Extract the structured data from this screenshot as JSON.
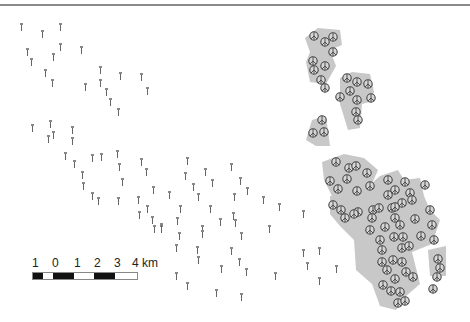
{
  "map": {
    "scale_bar": {
      "labels": [
        "1",
        "0",
        "1",
        "2",
        "3",
        "4 km"
      ],
      "unit": "km",
      "segments": [
        "black",
        "white",
        "black",
        "white",
        "black",
        "white"
      ]
    },
    "colors": {
      "frame_line": "#8a8a8a",
      "cluster_fill": "#c8c8c8",
      "symbol_stroke": "#444444",
      "turbine_mark": "#666666"
    },
    "legend_symbols": {
      "scattered": "turbine-icon",
      "clustered": "peace-circle-icon"
    }
  }
}
